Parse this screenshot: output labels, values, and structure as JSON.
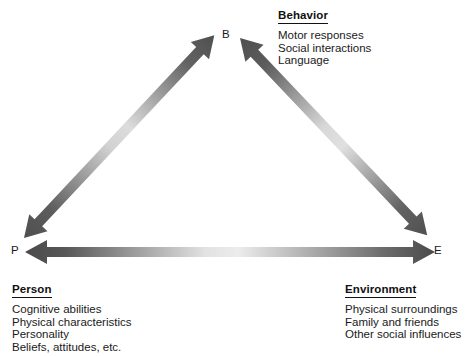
{
  "diagram": {
    "type": "triangle-bidirectional",
    "background_color": "#ffffff",
    "arrow_dark_color": "#555555",
    "arrow_light_color": "#e8e8e8",
    "text_color": "#1a1a1a",
    "nodes": [
      {
        "id": "B",
        "label": "B",
        "x": 227,
        "y": 35,
        "corner": "top"
      },
      {
        "id": "P",
        "label": "P",
        "x": 15,
        "y": 251,
        "corner": "bottom-left"
      },
      {
        "id": "E",
        "label": "E",
        "x": 437,
        "y": 251,
        "corner": "bottom-right"
      }
    ],
    "edges": [
      {
        "from": "P",
        "to": "B",
        "double_headed": true
      },
      {
        "from": "B",
        "to": "E",
        "double_headed": true
      },
      {
        "from": "P",
        "to": "E",
        "double_headed": true
      }
    ]
  },
  "blocks": {
    "behavior": {
      "heading": "Behavior",
      "items": [
        "Motor responses",
        "Social interactions",
        "Language"
      ]
    },
    "person": {
      "heading": "Person",
      "items": [
        "Cognitive abilities",
        "Physical characteristics",
        "Personality",
        "Beliefs, attitudes, etc."
      ]
    },
    "environment": {
      "heading": "Environment",
      "items": [
        "Physical surroundings",
        "Family and friends",
        "Other social influences"
      ]
    }
  }
}
